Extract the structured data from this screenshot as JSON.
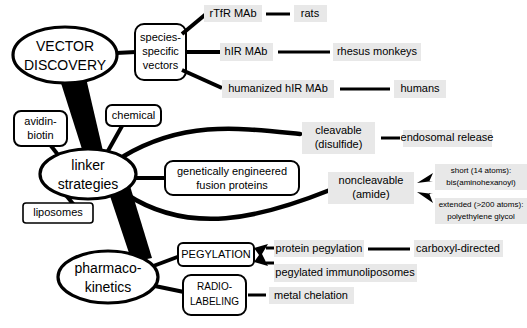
{
  "diagram": {
    "background_color": "#ffffff",
    "highlight_color": "#e8e8e8",
    "line_color": "#000000"
  },
  "hubs": {
    "vector_discovery": "VECTOR\nDISCOVERY",
    "vector_discovery_line1": "VECTOR",
    "vector_discovery_line2": "DISCOVERY",
    "linker_strategies_line1": "linker",
    "linker_strategies_line2": "strategies",
    "pharmacokinetics_line1": "pharmaco-",
    "pharmacokinetics_line2": "kinetics"
  },
  "vector_branch": {
    "species_specific_line1": "species-",
    "species_specific_line2": "specific",
    "species_specific_line3": "vectors",
    "vectors": [
      {
        "name": "rTfR MAb",
        "species": "rats"
      },
      {
        "name": "hIR MAb",
        "species": "rhesus monkeys"
      },
      {
        "name": "humanized hIR MAb",
        "species": "humans"
      }
    ]
  },
  "linker_branch": {
    "avidin_biotin_line1": "avidin-",
    "avidin_biotin_line2": "biotin",
    "chemical": "chemical",
    "liposomes": "liposomes",
    "fusion_proteins_line1": "genetically engineered",
    "fusion_proteins_line2": "fusion proteins",
    "cleavable_line1": "cleavable",
    "cleavable_line2": "(disulfide)",
    "endosomal_release": "endosomal release",
    "noncleavable_line1": "noncleavable",
    "noncleavable_line2": "(amide)",
    "short_linker_line1": "short (14 atoms):",
    "short_linker_line2": "bis(aminohexanoyl)",
    "extended_linker_line1": "extended (>200 atoms):",
    "extended_linker_line2": "polyethylene glycol"
  },
  "pharmacokinetics_branch": {
    "pegylation": "PEGYLATION",
    "radiolabeling_line1": "RADIO-",
    "radiolabeling_line2": "LABELING",
    "protein_pegylation": "protein pegylation",
    "carboxyl_directed": "carboxyl-directed",
    "pegylated_immunoliposomes": "pegylated immunoliposomes",
    "metal_chelation": "metal chelation"
  }
}
